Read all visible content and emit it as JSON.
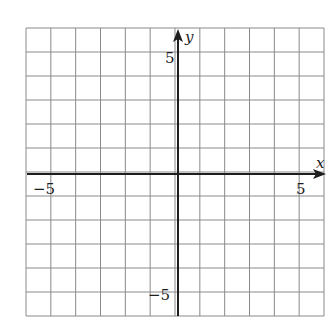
{
  "diagram": {
    "type": "coordinate-plane",
    "x_axis": {
      "label": "x",
      "range": [
        -6,
        6
      ],
      "tick_labels": [
        {
          "value": -5,
          "text": "−5"
        },
        {
          "value": 5,
          "text": "5"
        }
      ]
    },
    "y_axis": {
      "label": "y",
      "range": [
        -6,
        6
      ],
      "tick_labels": [
        {
          "value": 5,
          "text": "5"
        },
        {
          "value": -5,
          "text": "−5"
        }
      ]
    },
    "grid": {
      "columns": 12,
      "rows": 12,
      "unit": 1
    },
    "colors": {
      "grid": "#8a8a8a",
      "axis": "#1e1e1e",
      "background": "#ffffff"
    }
  }
}
